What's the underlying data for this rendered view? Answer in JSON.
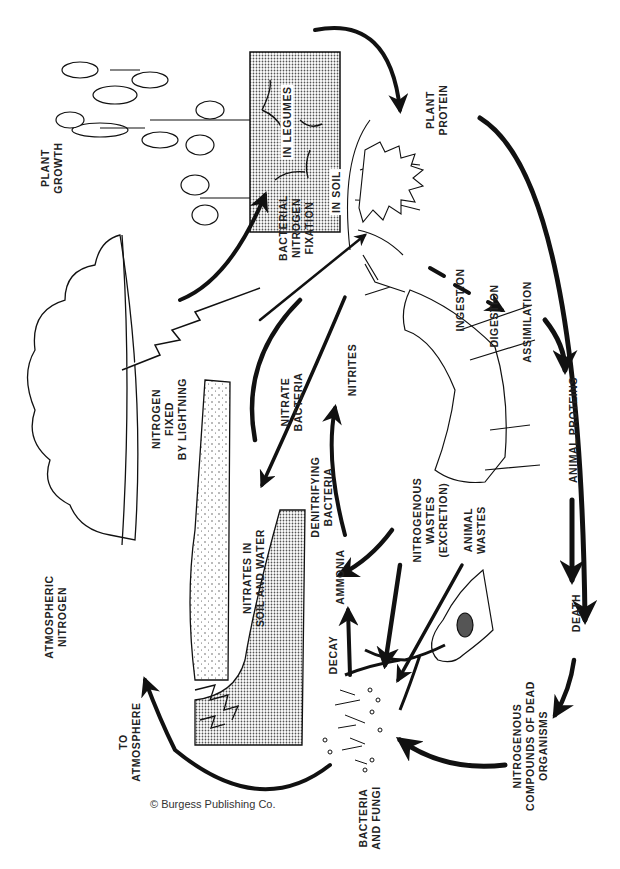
{
  "diagram": {
    "type": "nitrogen-cycle",
    "orientation": "rotated-90-ccw",
    "colors": {
      "ink": "#111111",
      "stipple_fill": "#b9b9b9",
      "paper": "#ffffff"
    }
  },
  "labels": {
    "plant_growth": [
      "PLANT",
      "GROWTH"
    ],
    "in_legumes": [
      "IN LEGUMES"
    ],
    "bacterial_fixation": [
      "BACTERIAL",
      "NITROGEN",
      "FIXATION"
    ],
    "in_soil": [
      "IN SOIL"
    ],
    "plant_protein": [
      "PLANT",
      "PROTEIN"
    ],
    "ingestion": [
      "INGESTION"
    ],
    "digestion": [
      "DIGESTION"
    ],
    "assimilation": [
      "ASSIMILATION"
    ],
    "atmospheric_nitrogen": [
      "ATMOSPHERIC",
      "NITROGEN"
    ],
    "lightning": [
      "NITROGEN",
      "FIXED",
      "BY LIGHTNING"
    ],
    "nitrate_bacteria": [
      "NITRATE",
      "BACTERIA"
    ],
    "nitrites": [
      "NITRITES"
    ],
    "nitrates_soil_water": [
      "NITRATES IN",
      "SOIL AND WATER"
    ],
    "denitrifying_bacteria": [
      "DENITRIFYING",
      "BACTERIA"
    ],
    "ammonia": [
      "AMMONIA"
    ],
    "nitrogenous_wastes": [
      "NITROGENOUS",
      "WASTES",
      "(EXCRETION)"
    ],
    "animal_wastes": [
      "ANIMAL",
      "WASTES"
    ],
    "animal_proteins": [
      "ANIMAL PROTEINS"
    ],
    "death": [
      "DEATH"
    ],
    "decay": [
      "DECAY"
    ],
    "dead_organisms": [
      "NITROGENOUS",
      "COMPOUNDS OF DEAD",
      "ORGANISMS"
    ],
    "bacteria_fungi": [
      "BACTERIA",
      "AND FUNGI"
    ],
    "to_atmosphere": [
      "TO",
      "ATMOSPHERE"
    ]
  },
  "credit": "© Burgess Publishing Co."
}
